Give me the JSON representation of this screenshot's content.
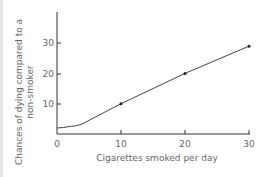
{
  "chart_data": {
    "type": "line",
    "title": "",
    "xlabel": "Cigarettes smoked per day",
    "ylabel": [
      "Chances of dying compared to a",
      "non-smoker"
    ],
    "x_ticks": [
      "0",
      "10",
      "20",
      "30"
    ],
    "y_ticks": [
      "10",
      "20",
      "30"
    ],
    "xlim": [
      0,
      31
    ],
    "ylim": [
      0,
      40
    ],
    "grid": false,
    "legend": null,
    "series": [
      {
        "name": "Relative risk",
        "x": [
          0,
          2,
          5,
          10,
          20,
          30
        ],
        "y": [
          2,
          2.5,
          4.5,
          10,
          20,
          29
        ],
        "markers": [
          {
            "x": 10,
            "y": 10
          },
          {
            "x": 20,
            "y": 20
          },
          {
            "x": 30,
            "y": 29
          }
        ]
      }
    ]
  },
  "colors": {
    "line": "#444444",
    "axis": "#333333",
    "text": "#666666"
  }
}
